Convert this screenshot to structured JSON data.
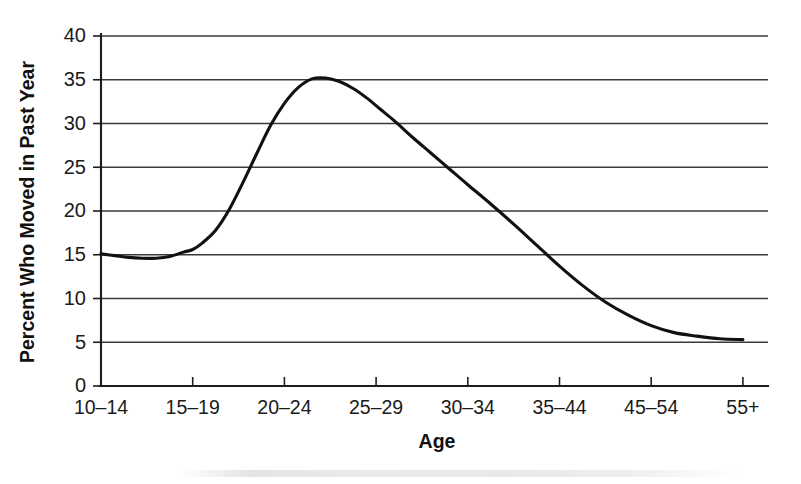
{
  "chart_data": {
    "type": "line",
    "title": "",
    "xlabel": "Age",
    "ylabel": "Percent Who Moved in Past Year",
    "categories": [
      "10–14",
      "15–19",
      "20–24",
      "25–29",
      "30–34",
      "35–44",
      "45–54",
      "55+"
    ],
    "x_tick_labels": [
      "10–14",
      "15–19",
      "20–24",
      "25–29",
      "30–34",
      "35–44",
      "45–54",
      "55+"
    ],
    "y_tick_labels": [
      "0",
      "5",
      "10",
      "15",
      "20",
      "25",
      "30",
      "35",
      "40"
    ],
    "y_ticks": [
      0,
      5,
      10,
      15,
      20,
      25,
      30,
      35,
      40
    ],
    "ylim": [
      0,
      40
    ],
    "grid": "horizontal",
    "legend": "none",
    "series": [
      {
        "name": "Percent Who Moved in Past Year",
        "values": [
          15.1,
          15.6,
          34.4,
          28.0,
          21.2,
          13.3,
          6.6,
          5.3
        ],
        "smoothed_curve_points": [
          [
            0.0,
            15.1
          ],
          [
            0.15,
            14.9
          ],
          [
            0.3,
            14.7
          ],
          [
            0.45,
            14.6
          ],
          [
            0.6,
            14.6
          ],
          [
            0.75,
            14.8
          ],
          [
            0.9,
            15.3
          ],
          [
            1.0,
            15.6
          ],
          [
            1.1,
            16.3
          ],
          [
            1.25,
            17.8
          ],
          [
            1.4,
            20.2
          ],
          [
            1.55,
            23.3
          ],
          [
            1.7,
            26.6
          ],
          [
            1.85,
            29.8
          ],
          [
            2.0,
            32.3
          ],
          [
            2.15,
            34.1
          ],
          [
            2.3,
            35.1
          ],
          [
            2.45,
            35.2
          ],
          [
            2.6,
            34.8
          ],
          [
            2.75,
            34.0
          ],
          [
            2.9,
            32.9
          ],
          [
            3.05,
            31.6
          ],
          [
            3.2,
            30.3
          ],
          [
            3.4,
            28.4
          ],
          [
            3.6,
            26.6
          ],
          [
            3.8,
            24.8
          ],
          [
            4.0,
            23.0
          ],
          [
            4.25,
            20.8
          ],
          [
            4.5,
            18.5
          ],
          [
            4.75,
            16.1
          ],
          [
            5.0,
            13.7
          ],
          [
            5.25,
            11.5
          ],
          [
            5.5,
            9.6
          ],
          [
            5.75,
            8.1
          ],
          [
            6.0,
            6.9
          ],
          [
            6.25,
            6.1
          ],
          [
            6.5,
            5.7
          ],
          [
            6.75,
            5.4
          ],
          [
            7.0,
            5.3
          ]
        ]
      }
    ],
    "peak": {
      "category": "20–24",
      "value": 35.2
    },
    "minimum": {
      "category": "55+",
      "value": 5.3
    },
    "colors": {
      "curve": "#111111",
      "gridline": "#3a3a3a",
      "axis": "#1d1d1d",
      "background": "#ffffff"
    }
  },
  "axes": {
    "y_title": "Percent Who Moved in Past Year",
    "x_title": "Age"
  }
}
